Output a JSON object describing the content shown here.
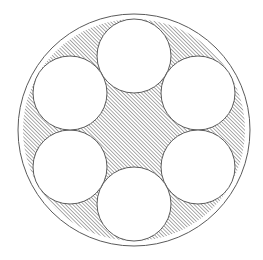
{
  "figure": {
    "background_color": "#ffffff",
    "stroke_color": "#5a5a5a",
    "stroke_width": 1,
    "canvas": {
      "width": 263,
      "height": 260
    }
  },
  "outer_circle": {
    "name": "outer circle",
    "center_x": 134,
    "center_y": 130,
    "radius": 116,
    "fill": "none",
    "stroke": "#5a5a5a"
  },
  "inner_circles": {
    "count": 6,
    "radius": 37,
    "ring_radius": 74,
    "fill": "#ffffff",
    "stroke": "#5a5a5a",
    "items": [
      {
        "label": "top circle",
        "angle_deg": 90,
        "center_x": 134,
        "center_y": 56
      },
      {
        "label": "upper-right circle",
        "angle_deg": 30,
        "center_x": 198,
        "center_y": 93
      },
      {
        "label": "lower-right circle",
        "angle_deg": -30,
        "center_x": 198,
        "center_y": 167
      },
      {
        "label": "bottom circle",
        "angle_deg": -90,
        "center_x": 134,
        "center_y": 204
      },
      {
        "label": "lower-left circle",
        "angle_deg": -150,
        "center_x": 70,
        "center_y": 167
      },
      {
        "label": "upper-left circle",
        "angle_deg": 150,
        "center_x": 70,
        "center_y": 93
      }
    ]
  },
  "shaded_region": {
    "label": "central hatched region",
    "description": "curved hexagon bounded by the six inner circles",
    "fill_pattern": "diagonal-hatch-45",
    "hatch_color": "#6e6e6e",
    "hatch_spacing_px": 2,
    "hatch_angle_deg": 45,
    "base_fill": "#ffffff",
    "vertex_radius": 64,
    "vertices": [
      {
        "angle_deg": 60,
        "x": 166,
        "y": 75
      },
      {
        "angle_deg": 0,
        "x": 198,
        "y": 130
      },
      {
        "angle_deg": -60,
        "x": 166,
        "y": 185
      },
      {
        "angle_deg": -120,
        "x": 102,
        "y": 185
      },
      {
        "angle_deg": 180,
        "x": 70,
        "y": 130
      },
      {
        "angle_deg": 120,
        "x": 102,
        "y": 75
      }
    ]
  }
}
